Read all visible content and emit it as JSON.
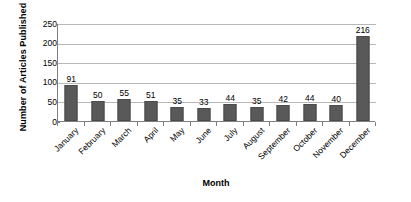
{
  "chart_data": {
    "type": "bar",
    "title": "",
    "xlabel": "Month",
    "ylabel": "Number of Articles Published",
    "categories": [
      "January",
      "February",
      "March",
      "April",
      "May",
      "June",
      "July",
      "August",
      "September",
      "October",
      "November",
      "December"
    ],
    "values": [
      91,
      50,
      55,
      51,
      35,
      33,
      44,
      35,
      42,
      44,
      40,
      216
    ],
    "series": [
      {
        "name": "Number of Articles Published",
        "values": [
          91,
          50,
          55,
          51,
          35,
          33,
          44,
          35,
          42,
          44,
          40,
          216
        ]
      }
    ],
    "ylim": [
      0,
      250
    ],
    "ytick_values": [
      0,
      50,
      100,
      150,
      200,
      250
    ],
    "ytick_labels": [
      "0",
      "50",
      "100",
      "150",
      "200",
      "250"
    ],
    "data_labels": [
      "91",
      "50",
      "55",
      "51",
      "35",
      "33",
      "44",
      "35",
      "42",
      "44",
      "40",
      "216"
    ],
    "grid": true,
    "grid_axis": "y",
    "legend": false,
    "legend_position": "none",
    "bar_color": "#595959",
    "gridline_color": "#b8b8b8",
    "axis_color": "#808080",
    "background_color": "#ffffff",
    "text_color": "#000000",
    "xtick_label_rotation": -45
  }
}
